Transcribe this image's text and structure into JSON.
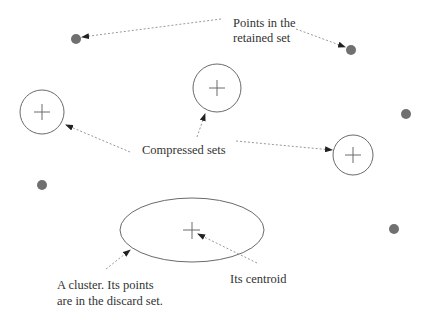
{
  "diagram": {
    "labels": {
      "retained_line1": "Points in the",
      "retained_line2": "retained set",
      "compressed": "Compressed sets",
      "cluster_line1": "A cluster.  Its points",
      "cluster_line2": "are in the discard set.",
      "centroid": "Its centroid"
    },
    "colors": {
      "point": "#707070",
      "outline": "#6a6a6a",
      "arrow": "#999999",
      "text": "#333333"
    },
    "retained_points": [
      {
        "x": 76,
        "y": 39
      },
      {
        "x": 351,
        "y": 50
      },
      {
        "x": 406,
        "y": 114
      },
      {
        "x": 42,
        "y": 185
      },
      {
        "x": 394,
        "y": 229
      }
    ],
    "compressed_sets": [
      {
        "cx": 42,
        "cy": 112,
        "r": 22
      },
      {
        "cx": 217,
        "cy": 88,
        "r": 24
      },
      {
        "cx": 353,
        "cy": 155,
        "r": 20
      }
    ],
    "cluster": {
      "cx": 192,
      "cy": 230,
      "rx": 72,
      "ry": 32
    }
  }
}
